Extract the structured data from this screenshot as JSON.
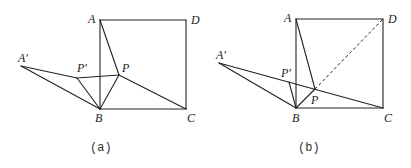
{
  "figures": [
    {
      "id": "a",
      "caption": "(a)",
      "points": {
        "A": {
          "label": "A",
          "x": 100,
          "y": 20
        },
        "D": {
          "label": "D",
          "x": 186,
          "y": 20
        },
        "B": {
          "label": "B",
          "x": 100,
          "y": 109
        },
        "C": {
          "label": "C",
          "x": 186,
          "y": 109
        },
        "P": {
          "label": "P",
          "x": 119,
          "y": 75
        },
        "Pp": {
          "label": "P′",
          "x": 77,
          "y": 78
        },
        "Ap": {
          "label": "A′",
          "x": 21,
          "y": 66
        }
      },
      "segments": [
        [
          "A",
          "D"
        ],
        [
          "D",
          "C"
        ],
        [
          "C",
          "B"
        ],
        [
          "B",
          "A"
        ],
        [
          "A",
          "P"
        ],
        [
          "P",
          "C"
        ],
        [
          "P",
          "B"
        ],
        [
          "P",
          "Pp"
        ],
        [
          "Pp",
          "B"
        ],
        [
          "Pp",
          "Ap"
        ],
        [
          "Ap",
          "B"
        ]
      ],
      "dashed_segments": []
    },
    {
      "id": "b",
      "caption": "(b)",
      "points": {
        "A": {
          "label": "A",
          "x": 296,
          "y": 19
        },
        "D": {
          "label": "D",
          "x": 383,
          "y": 19
        },
        "B": {
          "label": "B",
          "x": 296,
          "y": 108
        },
        "C": {
          "label": "C",
          "x": 383,
          "y": 108
        },
        "P": {
          "label": "P",
          "x": 315,
          "y": 89
        },
        "Pp": {
          "label": "P′",
          "x": 289,
          "y": 82
        },
        "Ap": {
          "label": "A′",
          "x": 219,
          "y": 63
        }
      },
      "segments": [
        [
          "A",
          "D"
        ],
        [
          "D",
          "C"
        ],
        [
          "C",
          "B"
        ],
        [
          "B",
          "A"
        ],
        [
          "A",
          "P"
        ],
        [
          "P",
          "B"
        ],
        [
          "Pp",
          "B"
        ],
        [
          "Ap",
          "C"
        ],
        [
          "Ap",
          "B"
        ]
      ],
      "dashed_segments": [
        [
          "P",
          "D"
        ]
      ]
    }
  ],
  "labels": {
    "a": {
      "A": {
        "text": "A",
        "x": 88,
        "y": 23
      },
      "D": {
        "text": "D",
        "x": 191,
        "y": 24
      },
      "B": {
        "text": "B",
        "x": 95,
        "y": 122
      },
      "C": {
        "text": "C",
        "x": 187,
        "y": 122
      },
      "P": {
        "text": "P",
        "x": 122,
        "y": 72
      },
      "Pp": {
        "text": "P′",
        "x": 77,
        "y": 72
      },
      "Ap": {
        "text": "A′",
        "x": 18,
        "y": 62
      },
      "caption": {
        "text": "(a)",
        "x": 90,
        "y": 151
      }
    },
    "b": {
      "A": {
        "text": "A",
        "x": 284,
        "y": 22
      },
      "D": {
        "text": "D",
        "x": 388,
        "y": 23
      },
      "B": {
        "text": "B",
        "x": 292,
        "y": 122
      },
      "C": {
        "text": "C",
        "x": 384,
        "y": 122
      },
      "P": {
        "text": "P",
        "x": 311,
        "y": 104
      },
      "Pp": {
        "text": "P′",
        "x": 281,
        "y": 77
      },
      "Ap": {
        "text": "A′",
        "x": 216,
        "y": 59
      },
      "caption": {
        "text": "(b)",
        "x": 298,
        "y": 151
      }
    }
  }
}
